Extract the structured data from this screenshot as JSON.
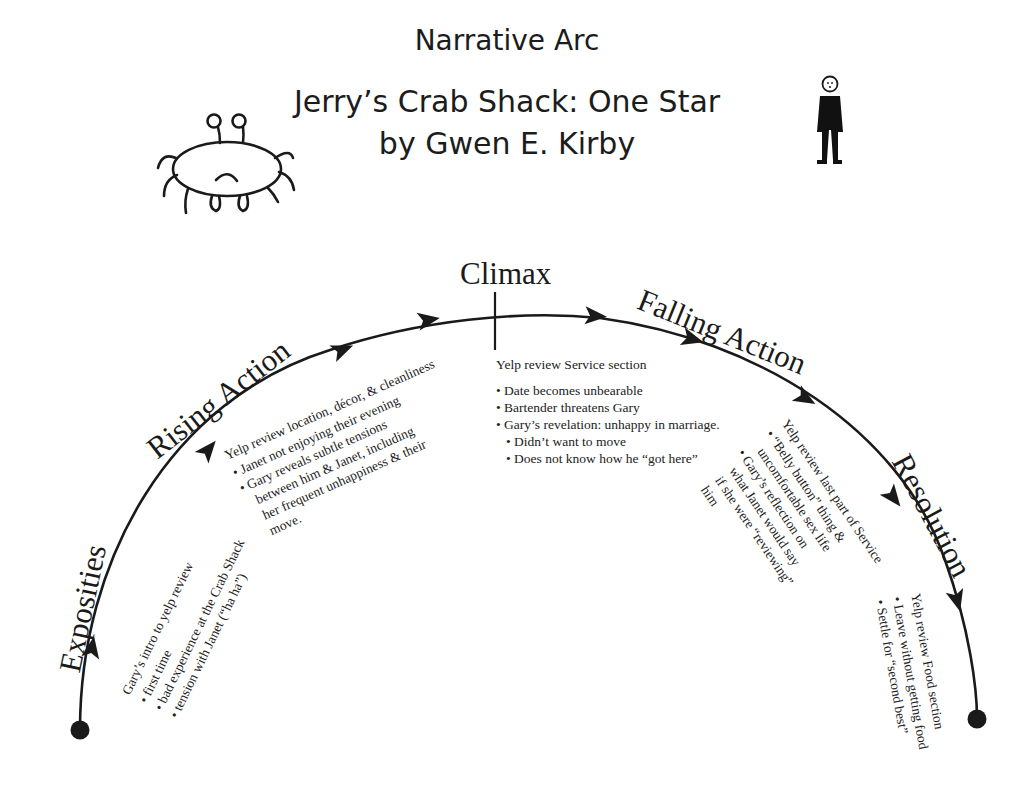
{
  "header": {
    "title": "Narrative Arc",
    "story_title": "Jerry’s Crab Shack: One Star",
    "byline": "by Gwen E. Kirby"
  },
  "illustrations": {
    "left": "crab-drawing",
    "right": "stick-figure-person"
  },
  "arc": {
    "stroke_color": "#1a1a1a",
    "start_marker": "filled-circle",
    "end_marker": "filled-circle"
  },
  "stages": [
    {
      "label": "Exposities",
      "heading": "Gary’s intro to yelp review",
      "bullets": [
        "first time",
        "bad experience at the Crab Shack",
        "tension with Janet (“ha ha”)"
      ]
    },
    {
      "label": "Rising Action",
      "heading": "Yelp review location, décor, & cleanliness",
      "bullets": [
        "Janet not enjoying their evening",
        "Gary reveals subtle tensions"
      ],
      "continuation": [
        "between him & Janet,  including",
        "her frequent unhappiness & their",
        "move."
      ]
    },
    {
      "label": "Climax",
      "heading": "Yelp review Service section",
      "bullets": [
        "Date becomes unbearable",
        "Bartender threatens Gary",
        "Gary’s revelation: unhappy in marriage."
      ],
      "sub_bullets": [
        "Didn’t want to move",
        "Does not know how he “got here”"
      ]
    },
    {
      "label": "Falling Action",
      "heading": "Yelp review  last part of Service",
      "lines": [
        "“Belly button” thing &",
        "uncomfortable sex life",
        "Gary’s reflection on",
        "what Janet would say",
        "if she were “reviewing”",
        "him"
      ]
    },
    {
      "label": "Resolution",
      "heading": "Yelp review Food section",
      "bullets": [
        "Leave without getting food",
        "Settle for “second best”"
      ]
    }
  ]
}
